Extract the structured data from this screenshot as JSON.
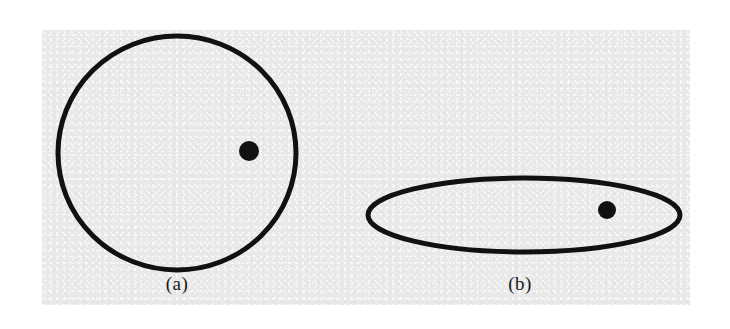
{
  "figure": {
    "background_color": "#ffffff",
    "plate_color": "#e9e9e9",
    "ink_color": "#111111",
    "width": 730,
    "height": 329
  },
  "panels": [
    {
      "id": "a",
      "caption": "(a)",
      "shape_name": "circle-outline",
      "shape_type": "ellipse",
      "center_x": 177,
      "center_y": 153,
      "radius_x": 119,
      "radius_y": 117,
      "stroke_width": 5,
      "stroke_color": "#111111",
      "fill": "none",
      "marker": {
        "name": "filled-dot",
        "center_x": 249,
        "center_y": 151,
        "radius": 10,
        "fill_color": "#111111"
      }
    },
    {
      "id": "b",
      "caption": "(b)",
      "shape_name": "flattened-ellipse-outline",
      "shape_type": "ellipse",
      "center_x": 524,
      "center_y": 215,
      "radius_x": 156,
      "radius_y": 37,
      "stroke_width": 5,
      "stroke_color": "#111111",
      "fill": "none",
      "marker": {
        "name": "filled-dot",
        "center_x": 607,
        "center_y": 210,
        "radius": 9,
        "fill_color": "#111111"
      }
    }
  ]
}
